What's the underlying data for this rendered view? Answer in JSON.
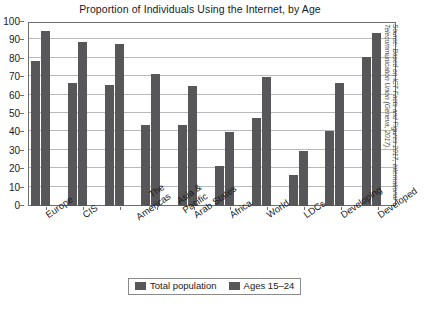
{
  "chart_data": {
    "type": "bar",
    "title": "Proportion of Individuals Using the Internet, by Age",
    "xlabel": "",
    "ylabel": "",
    "ylim": [
      0,
      100
    ],
    "yticks": [
      0,
      10,
      20,
      30,
      40,
      50,
      60,
      70,
      80,
      90,
      100
    ],
    "grid": true,
    "legend_position": "bottom-center",
    "categories": [
      "Europe",
      "CIS",
      "The Americas",
      "Asia & Pacific",
      "Arab States",
      "Africa",
      "World",
      "LDCs",
      "Developing",
      "Developed"
    ],
    "series": [
      {
        "name": "Total population",
        "color": "#57575a",
        "values": [
          79,
          67,
          66,
          44,
          44,
          21.5,
          48,
          17,
          41,
          81
        ]
      },
      {
        "name": "Ages 15–24",
        "color": "#57575a",
        "values": [
          95,
          89,
          88,
          72,
          65,
          40,
          70,
          30,
          67,
          94
        ]
      }
    ],
    "annotations": [
      "Source: Based on ICT Facts and Figures 2017, International Telecommunication Union (Geneva, 2017)."
    ]
  },
  "source_note": {
    "line1": "Source: Based on ICT Facts and Figures 2017, International",
    "line2": "Telecommunication Union (Geneva, 2017)."
  },
  "colors": {
    "bar": "#57575a",
    "grid": "#b9b9b9",
    "frame": "#6e6e6e",
    "text": "#1a1a1a",
    "background": "#ffffff"
  }
}
